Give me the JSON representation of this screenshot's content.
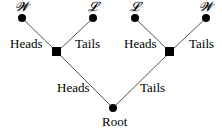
{
  "diagram": {
    "type": "game-tree",
    "root": {
      "label": "Root"
    },
    "edges": {
      "root_left": "Heads",
      "root_right": "Tails",
      "left_left": "Heads",
      "left_right": "Tails",
      "right_left": "Heads",
      "right_right": "Tails"
    },
    "leaves": [
      "𝓦",
      "𝓛",
      "𝓛",
      "𝓦"
    ],
    "colors": {
      "line": "#555555",
      "node": "#000000"
    }
  }
}
